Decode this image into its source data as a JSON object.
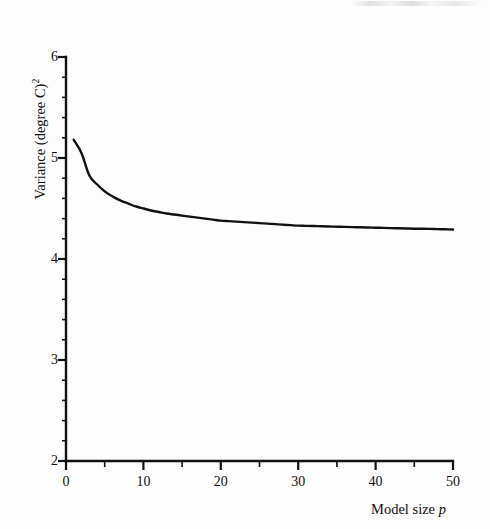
{
  "figure": {
    "background_color": "#fdfdfd",
    "ink_color": "#111111"
  },
  "axes": {
    "y_title_main": "Variance (degree C)",
    "y_title_exponent": "2",
    "x_title_main": "Model size ",
    "x_title_italic": "p"
  },
  "chart_data": {
    "type": "line",
    "title": "",
    "subtitle": "",
    "xlabel": "Model size p",
    "ylabel": "Variance (degree C)2",
    "xlim": [
      0,
      50
    ],
    "ylim": [
      2,
      6
    ],
    "grid": false,
    "legend": null,
    "x_ticks_major": [
      0,
      10,
      20,
      30,
      40,
      50
    ],
    "x_tick_labels": [
      "0",
      "10",
      "20",
      "30",
      "40",
      "50"
    ],
    "x_ticks_minor": [
      5,
      15,
      25,
      35,
      45
    ],
    "y_ticks_major": [
      2,
      3,
      4,
      5,
      6
    ],
    "y_tick_labels": [
      "2",
      "3",
      "4",
      "5",
      "6"
    ],
    "y_ticks_minor": [
      2.2,
      2.4,
      2.6,
      2.8,
      3.2,
      3.4,
      3.6,
      3.8,
      4.2,
      4.4,
      4.6,
      4.8,
      5.2,
      5.4,
      5.6,
      5.8
    ],
    "series": [
      {
        "name": "Variance",
        "color": "#111111",
        "line_width": 2.4,
        "x": [
          1,
          2,
          3,
          4,
          5,
          6,
          7,
          8,
          9,
          10,
          11,
          12,
          13,
          14,
          15,
          16,
          17,
          18,
          19,
          20,
          21,
          22,
          23,
          24,
          25,
          26,
          27,
          28,
          29,
          30,
          31,
          32,
          33,
          34,
          35,
          36,
          37,
          38,
          39,
          40,
          41,
          42,
          43,
          44,
          45,
          46,
          47,
          48,
          49,
          50
        ],
        "values": [
          5.18,
          5.05,
          4.83,
          4.74,
          4.67,
          4.62,
          4.58,
          4.55,
          4.52,
          4.5,
          4.48,
          4.465,
          4.45,
          4.44,
          4.43,
          4.42,
          4.41,
          4.4,
          4.39,
          4.38,
          4.375,
          4.37,
          4.365,
          4.36,
          4.355,
          4.35,
          4.345,
          4.34,
          4.335,
          4.33,
          4.328,
          4.326,
          4.324,
          4.322,
          4.32,
          4.318,
          4.316,
          4.314,
          4.312,
          4.31,
          4.308,
          4.306,
          4.304,
          4.302,
          4.3,
          4.299,
          4.298,
          4.296,
          4.294,
          4.292
        ]
      }
    ]
  }
}
